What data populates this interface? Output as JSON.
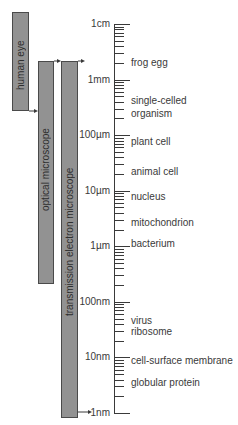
{
  "instruments": [
    {
      "label": "human eye"
    },
    {
      "label": "optical microscope"
    },
    {
      "label": "transmission electron microscope"
    }
  ],
  "scale": {
    "decade_labels": [
      "1cm",
      "1mm",
      "100µm",
      "10µm",
      "1µm",
      "100nm",
      "10nm",
      "1nm"
    ],
    "minor_ticks_per_decade": [
      9,
      8,
      7,
      6,
      5,
      4,
      3,
      2
    ]
  },
  "objects": [
    {
      "label": "frog egg"
    },
    {
      "label": "single-celled",
      "label2": "organism"
    },
    {
      "label": "plant cell"
    },
    {
      "label": "animal cell"
    },
    {
      "label": "nucleus"
    },
    {
      "label": "mitochondrion"
    },
    {
      "label": "bacterium"
    },
    {
      "label": "virus"
    },
    {
      "label": "ribosome"
    },
    {
      "label": "cell-surface membrane"
    },
    {
      "label": "globular protein"
    }
  ],
  "colors": {
    "bar_fill": "#929292",
    "bar_border": "#4a4a4a",
    "line": "#3a3a3a",
    "text": "#3a3a3a"
  }
}
